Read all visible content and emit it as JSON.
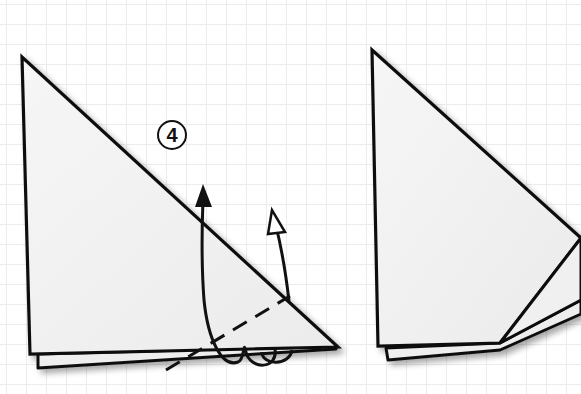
{
  "diagram": {
    "type": "origami-instructions",
    "step_number": "4",
    "colors": {
      "paper": "#f2f2f2",
      "paper_shade": "#e6e6e6",
      "line": "#111111",
      "grid": "#ececec",
      "background": "#ffffff"
    },
    "figures": [
      {
        "name": "before-fold",
        "description": "Folded triangle with valley fold line and arrows"
      },
      {
        "name": "after-fold",
        "description": "Result with flap folded outward"
      }
    ],
    "annotations": {
      "fold_line": "dashed valley fold",
      "arrows": [
        "fold-up-arrow",
        "push-in-arrow"
      ]
    }
  }
}
